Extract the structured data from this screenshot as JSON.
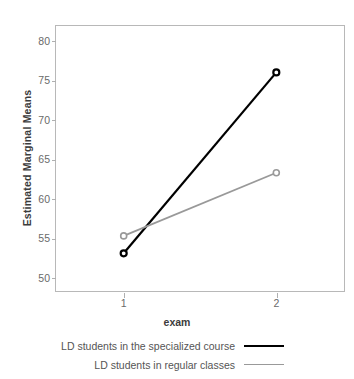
{
  "chart_data": {
    "type": "line",
    "title": "",
    "xlabel": "exam",
    "ylabel": "Estimated Marginal Means",
    "categories": [
      "1",
      "2"
    ],
    "x": [
      1,
      2
    ],
    "xlim": [
      0.55,
      2.45
    ],
    "ylim": [
      48.2,
      82.0
    ],
    "yticks": [
      50,
      55,
      60,
      65,
      70,
      75,
      80
    ],
    "ytick_labels": [
      "50",
      "55",
      "60",
      "65",
      "70",
      "75",
      "80"
    ],
    "xticks": [
      1,
      2
    ],
    "xtick_labels": [
      "1",
      "2"
    ],
    "grid": false,
    "legend_position": "bottom",
    "series": [
      {
        "name": "LD students in the specialized course",
        "values": [
          53.1,
          76.0
        ],
        "color": "#000000",
        "marker": "circle-open"
      },
      {
        "name": "LD students in regular classes",
        "values": [
          55.3,
          63.3
        ],
        "color": "#999999",
        "marker": "circle-open"
      }
    ]
  },
  "legend": {
    "items": [
      {
        "label": "LD students in the specialized course",
        "color": "#000000"
      },
      {
        "label": "LD students in regular classes",
        "color": "#999999"
      }
    ]
  },
  "colors": {
    "frame": "#b8b8b8",
    "tick": "#b0b0b0",
    "text": "#555555",
    "axis_title": "#3c3c3c",
    "background": "#ffffff"
  }
}
